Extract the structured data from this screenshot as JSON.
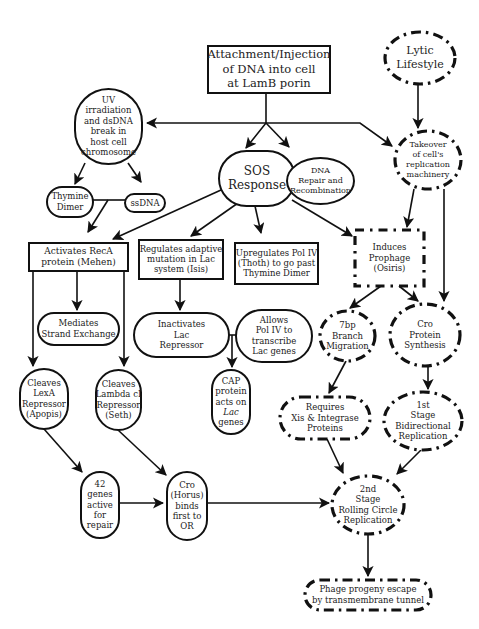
{
  "diagram": {
    "type": "flowchart",
    "top_cut_text": "· · · · ·",
    "nodes": [
      {
        "id": "attachment",
        "shape": "rect",
        "style": "solid",
        "x": 208,
        "y": 46,
        "w": 122,
        "h": 47,
        "lines": [
          "Attachment/Injection",
          "of DNA into cell",
          "at LamB porin"
        ],
        "font": 11.5
      },
      {
        "id": "lytic",
        "shape": "ellipse",
        "style": "dashdot",
        "x": 385,
        "y": 32,
        "w": 70,
        "h": 52,
        "lines": [
          "Lytic",
          "Lifestyle"
        ],
        "font": 11
      },
      {
        "id": "uv",
        "shape": "pill-v",
        "style": "solid",
        "x": 75,
        "y": 89,
        "w": 67,
        "h": 75,
        "lines": [
          "UV",
          "irradiation",
          "and dsDNA",
          "break in",
          "host cell",
          "chromosome"
        ],
        "font": 8.5
      },
      {
        "id": "takeover",
        "shape": "ellipse",
        "style": "dashdot",
        "x": 395,
        "y": 131,
        "w": 66,
        "h": 58,
        "lines": [
          "Takeover",
          "of cell's",
          "replication",
          "machinery"
        ],
        "font": 8
      },
      {
        "id": "sos",
        "shape": "pill-h",
        "style": "solid",
        "x": 219,
        "y": 151,
        "w": 76,
        "h": 55,
        "lines": [
          "SOS",
          "Response"
        ],
        "font": 12
      },
      {
        "id": "dna-repair",
        "shape": "ellipse",
        "style": "solid",
        "x": 287,
        "y": 158,
        "w": 67,
        "h": 46,
        "lines": [
          "DNA",
          "Repair and",
          "Recombination"
        ],
        "font": 8
      },
      {
        "id": "thymine",
        "shape": "pill-h",
        "style": "solid",
        "x": 47,
        "y": 187,
        "w": 46,
        "h": 30,
        "lines": [
          "Thymine",
          "Dimer"
        ],
        "font": 8.5
      },
      {
        "id": "ssdna",
        "shape": "pill-h",
        "style": "solid",
        "x": 125,
        "y": 194,
        "w": 40,
        "h": 18,
        "lines": [
          "ssDNA"
        ],
        "font": 8.5
      },
      {
        "id": "activates-reca",
        "shape": "rect",
        "style": "solid",
        "x": 29,
        "y": 243,
        "w": 99,
        "h": 28,
        "lines": [
          "Activates RecA",
          "protein (Mehen)"
        ],
        "font": 9
      },
      {
        "id": "regulates-adaptive",
        "shape": "rect",
        "style": "solid",
        "x": 139,
        "y": 240,
        "w": 84,
        "h": 39,
        "lines": [
          "Regulates adaptive",
          "mutation in Lac",
          "system (Isis)"
        ],
        "font": 8.5
      },
      {
        "id": "upregulates-pol",
        "shape": "rect",
        "style": "solid",
        "x": 235,
        "y": 243,
        "w": 83,
        "h": 41,
        "lines": [
          "Upregulates Pol IV",
          "(Thoth) to go past",
          "Thymine Dimer"
        ],
        "font": 8.5
      },
      {
        "id": "induces-prophage",
        "shape": "rect",
        "style": "dashed",
        "x": 355,
        "y": 230,
        "w": 69,
        "h": 56,
        "lines": [
          "Induces",
          "Prophage",
          "(Osiris)"
        ],
        "font": 8.5
      },
      {
        "id": "mediates",
        "shape": "pill-h",
        "style": "solid",
        "x": 38,
        "y": 313,
        "w": 81,
        "h": 32,
        "lines": [
          "Mediates",
          "Strand Exchange"
        ],
        "font": 8.5
      },
      {
        "id": "inactivates-lac",
        "shape": "pill-h",
        "style": "solid",
        "x": 134,
        "y": 313,
        "w": 95,
        "h": 44,
        "lines": [
          "Inactivates",
          "Lac",
          "Repressor"
        ],
        "font": 8.5
      },
      {
        "id": "allows-pol",
        "shape": "pill-h",
        "style": "solid",
        "x": 236,
        "y": 310,
        "w": 76,
        "h": 52,
        "lines": [
          "Allows",
          "Pol IV to",
          "transcribe",
          "Lac genes"
        ],
        "font": 8.5
      },
      {
        "id": "branch",
        "shape": "ellipse",
        "style": "dashdot",
        "x": 320,
        "y": 311,
        "w": 55,
        "h": 50,
        "lines": [
          "7bp",
          "Branch",
          "Migration"
        ],
        "font": 8.5
      },
      {
        "id": "cro-synthesis",
        "shape": "ellipse",
        "style": "dashdot",
        "x": 390,
        "y": 304,
        "w": 70,
        "h": 62,
        "lines": [
          "Cro",
          "Protein",
          "Synthesis"
        ],
        "font": 8.5
      },
      {
        "id": "cleaves-lexa",
        "shape": "pill-v",
        "style": "solid",
        "x": 20,
        "y": 369,
        "w": 48,
        "h": 60,
        "lines": [
          "Cleaves",
          "LexA",
          "Repressor",
          "(Apopis)"
        ],
        "font": 8.5
      },
      {
        "id": "cleaves-lambda",
        "shape": "pill-v",
        "style": "solid",
        "x": 96,
        "y": 370,
        "w": 45,
        "h": 60,
        "lines": [
          "Cleaves",
          "Lambda cI",
          "Repressor",
          "(Seth)"
        ],
        "font": 8.5
      },
      {
        "id": "cap",
        "shape": "pill-v",
        "style": "solid",
        "x": 212,
        "y": 370,
        "w": 38,
        "h": 64,
        "lines": [
          "CAP",
          "protein",
          "acts on",
          "Lac",
          "genes"
        ],
        "font": 8.5,
        "italic_line": 3
      },
      {
        "id": "requires-xis",
        "shape": "pill-h",
        "style": "dashdot",
        "x": 280,
        "y": 397,
        "w": 90,
        "h": 42,
        "lines": [
          "Requires",
          "Xis & Integrase",
          "Proteins"
        ],
        "font": 8.5
      },
      {
        "id": "first-stage",
        "shape": "ellipse",
        "style": "dashdot",
        "x": 384,
        "y": 392,
        "w": 78,
        "h": 58,
        "lines": [
          "1st",
          "Stage",
          "Bidirectional",
          "Replication"
        ],
        "font": 8.5
      },
      {
        "id": "genes-42",
        "shape": "pill-v",
        "style": "solid",
        "x": 81,
        "y": 472,
        "w": 38,
        "h": 66,
        "lines": [
          "42",
          "genes",
          "active",
          "for",
          "repair"
        ],
        "font": 8.5
      },
      {
        "id": "cro-horus",
        "shape": "pill-v",
        "style": "solid",
        "x": 167,
        "y": 472,
        "w": 40,
        "h": 68,
        "lines": [
          "Cro",
          "(Horus)",
          "binds",
          "first to",
          "OR"
        ],
        "font": 8.5
      },
      {
        "id": "second-stage",
        "shape": "ellipse",
        "style": "dashdot",
        "x": 332,
        "y": 476,
        "w": 72,
        "h": 58,
        "lines": [
          "2nd",
          "Stage",
          "Rolling Circle",
          "Replication"
        ],
        "font": 8.5
      },
      {
        "id": "phage-escape",
        "shape": "pill-h",
        "style": "dashdot",
        "x": 305,
        "y": 580,
        "w": 126,
        "h": 30,
        "lines": [
          "Phage progeny escape",
          "by transmembrane tunnel"
        ],
        "font": 8.5
      }
    ],
    "edges": [
      {
        "from": "attachment",
        "to": "sos",
        "points": [
          [
            266,
            93
          ],
          [
            266,
            123
          ],
          [
            246,
            148
          ]
        ],
        "arrow": true
      },
      {
        "from": "attachment",
        "to": "dna-repair",
        "points": [
          [
            266,
            123
          ],
          [
            289,
            147
          ]
        ],
        "arrow": true
      },
      {
        "from": "attachment",
        "to": "uv",
        "points": [
          [
            266,
            123
          ],
          [
            147,
            123
          ]
        ],
        "arrow": true
      },
      {
        "from": "attachment",
        "to": "takeover",
        "points": [
          [
            266,
            123
          ],
          [
            360,
            123
          ],
          [
            392,
            146
          ]
        ],
        "arrow": true
      },
      {
        "from": "lytic",
        "to": "takeover",
        "points": [
          [
            418,
            84
          ],
          [
            418,
            128
          ]
        ],
        "arrow": true
      },
      {
        "from": "uv",
        "to": "thymine",
        "points": [
          [
            85,
            163
          ],
          [
            75,
            184
          ]
        ],
        "arrow": true
      },
      {
        "from": "uv",
        "to": "ssdna",
        "points": [
          [
            128,
            163
          ],
          [
            141,
            182
          ]
        ],
        "arrow": true
      },
      {
        "from": "thymine",
        "to": "ssdna",
        "points": [
          [
            93,
            200
          ],
          [
            125,
            200
          ]
        ],
        "arrow": false
      },
      {
        "from": "thymine-ssdna-junction",
        "to": "activates-reca",
        "points": [
          [
            108,
            200
          ],
          [
            88,
            232
          ]
        ],
        "arrow": true
      },
      {
        "from": "sos",
        "to": "activates-reca",
        "points": [
          [
            221,
            190
          ],
          [
            113,
            239
          ]
        ],
        "arrow": true
      },
      {
        "from": "sos",
        "to": "regulates-adaptive",
        "points": [
          [
            238,
            203
          ],
          [
            191,
            236
          ]
        ],
        "arrow": true
      },
      {
        "from": "sos",
        "to": "upregulates-pol",
        "points": [
          [
            255,
            206
          ],
          [
            261,
            233
          ]
        ],
        "arrow": true
      },
      {
        "from": "sos",
        "to": "induces-prophage",
        "points": [
          [
            292,
            200
          ],
          [
            352,
            236
          ]
        ],
        "arrow": true
      },
      {
        "from": "sos",
        "to": "dna-repair",
        "points": [
          [
            295,
            180
          ],
          [
            287,
            180
          ]
        ],
        "arrow": false
      },
      {
        "from": "takeover",
        "to": "induces-prophage",
        "points": [
          [
            414,
            189
          ],
          [
            407,
            227
          ]
        ],
        "arrow": true
      },
      {
        "from": "takeover",
        "to": "cro-synthesis",
        "points": [
          [
            444,
            189
          ],
          [
            444,
            301
          ]
        ],
        "arrow": true
      },
      {
        "from": "induces-prophage",
        "to": "branch",
        "points": [
          [
            381,
            286
          ],
          [
            350,
            308
          ]
        ],
        "arrow": true
      },
      {
        "from": "induces-prophage",
        "to": "cro-synthesis",
        "points": [
          [
            399,
            286
          ],
          [
            418,
            301
          ]
        ],
        "arrow": true
      },
      {
        "from": "activates-reca",
        "to": "mediates",
        "points": [
          [
            77,
            271
          ],
          [
            77,
            310
          ]
        ],
        "arrow": true
      },
      {
        "from": "activates-reca",
        "to": "cleaves-lexa",
        "points": [
          [
            33,
            271
          ],
          [
            33,
            366
          ]
        ],
        "arrow": true
      },
      {
        "from": "activates-reca",
        "to": "cleaves-lambda",
        "points": [
          [
            124,
            271
          ],
          [
            124,
            366
          ]
        ],
        "arrow": true
      },
      {
        "from": "regulates-adaptive",
        "to": "inactivates-lac",
        "points": [
          [
            180,
            279
          ],
          [
            180,
            310
          ]
        ],
        "arrow": true
      },
      {
        "from": "inactivates-lac",
        "to": "allows-pol",
        "points": [
          [
            229,
            335
          ],
          [
            236,
            335
          ]
        ],
        "arrow": false
      },
      {
        "from": "lac-junction",
        "to": "cap",
        "points": [
          [
            232,
            335
          ],
          [
            232,
            367
          ]
        ],
        "arrow": true
      },
      {
        "from": "branch",
        "to": "requires-xis",
        "points": [
          [
            346,
            361
          ],
          [
            329,
            393
          ]
        ],
        "arrow": true
      },
      {
        "from": "cro-synthesis",
        "to": "first-stage",
        "points": [
          [
            428,
            366
          ],
          [
            428,
            389
          ]
        ],
        "arrow": true
      },
      {
        "from": "cleaves-lexa",
        "to": "genes-42",
        "points": [
          [
            44,
            429
          ],
          [
            82,
            472
          ]
        ],
        "arrow": true
      },
      {
        "from": "cleaves-lambda",
        "to": "cro-horus",
        "points": [
          [
            118,
            430
          ],
          [
            166,
            475
          ]
        ],
        "arrow": true
      },
      {
        "from": "genes-42",
        "to": "cro-horus",
        "points": [
          [
            119,
            503
          ],
          [
            163,
            503
          ]
        ],
        "arrow": true
      },
      {
        "from": "cro-horus",
        "to": "second-stage",
        "points": [
          [
            207,
            503
          ],
          [
            329,
            503
          ]
        ],
        "arrow": true
      },
      {
        "from": "requires-xis",
        "to": "second-stage",
        "points": [
          [
            327,
            439
          ],
          [
            343,
            473
          ]
        ],
        "arrow": true
      },
      {
        "from": "first-stage",
        "to": "second-stage",
        "points": [
          [
            421,
            450
          ],
          [
            397,
            474
          ]
        ],
        "arrow": true
      },
      {
        "from": "second-stage",
        "to": "phage-escape",
        "points": [
          [
            368,
            534
          ],
          [
            368,
            576
          ]
        ],
        "arrow": true
      }
    ]
  }
}
